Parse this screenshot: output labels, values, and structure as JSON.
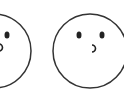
{
  "faces": [
    {
      "id": "left-face",
      "cx": -6,
      "cy": 51,
      "r": 37,
      "eyes": [
        {
          "cx": 7,
          "cy": 35
        }
      ],
      "mouth": {
        "cx": 0,
        "cy": 47
      }
    },
    {
      "id": "right-face",
      "cx": 90,
      "cy": 51,
      "r": 37,
      "eyes": [
        {
          "cx": 79,
          "cy": 35
        },
        {
          "cx": 102,
          "cy": 35
        }
      ],
      "mouth": {
        "cx": 95,
        "cy": 49
      }
    }
  ],
  "colors": {
    "stroke": "#333333",
    "fill": "#ffffff",
    "feature": "#222222"
  }
}
